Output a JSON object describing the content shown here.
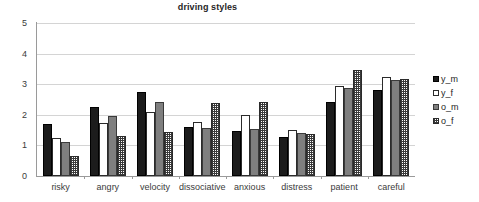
{
  "chart_data": {
    "type": "bar",
    "title": "driving styles",
    "xlabel": "",
    "ylabel": "",
    "ylim": [
      0,
      5
    ],
    "yticks": [
      0,
      1,
      2,
      3,
      4,
      5
    ],
    "grid": true,
    "legend_position": "right",
    "categories": [
      "risky",
      "angry",
      "velocity",
      "dissociative",
      "anxious",
      "distress",
      "patient",
      "careful"
    ],
    "series": [
      {
        "name": "y_m",
        "color": "#1c1c1c",
        "pattern": "solid-black",
        "values": [
          1.7,
          2.25,
          2.73,
          1.6,
          1.48,
          1.27,
          2.42,
          2.82
        ]
      },
      {
        "name": "y_f",
        "color": "#ffffff",
        "pattern": "open-white",
        "values": [
          1.25,
          1.73,
          2.08,
          1.78,
          2.0,
          1.5,
          2.93,
          3.25
        ]
      },
      {
        "name": "o_m",
        "color": "#7f7f7f",
        "pattern": "solid-gray",
        "values": [
          1.1,
          1.95,
          2.42,
          1.58,
          1.55,
          1.42,
          2.88,
          3.15
        ]
      },
      {
        "name": "o_f",
        "color": "#3a3a3a",
        "pattern": "checkered",
        "values": [
          0.65,
          1.3,
          1.43,
          2.38,
          2.43,
          1.37,
          3.45,
          3.18
        ]
      }
    ]
  },
  "legend": {
    "items": [
      {
        "label": "y_m"
      },
      {
        "label": "y_f"
      },
      {
        "label": "o_m"
      },
      {
        "label": "o_f"
      }
    ]
  },
  "axis": {
    "y_tick_labels": [
      "5",
      "4",
      "3",
      "2",
      "1",
      "0"
    ]
  }
}
